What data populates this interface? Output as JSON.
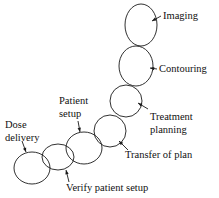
{
  "diagram": {
    "type": "chain-of-ellipses-flow",
    "stroke_color": "#1a1a1a",
    "background_color": "#ffffff",
    "text_color": "#111111",
    "nodes": [
      {
        "id": "imaging",
        "order": 1,
        "cx": 141,
        "cy": 25,
        "rx": 16,
        "ry": 21
      },
      {
        "id": "contouring",
        "order": 2,
        "cx": 136,
        "cy": 66,
        "rx": 17,
        "ry": 20
      },
      {
        "id": "treatment-planning",
        "order": 3,
        "cx": 126,
        "cy": 101,
        "rx": 16,
        "ry": 16
      },
      {
        "id": "transfer-of-plan",
        "order": 4,
        "cx": 110,
        "cy": 131,
        "rx": 16,
        "ry": 16
      },
      {
        "id": "patient-setup",
        "order": 5,
        "cx": 84,
        "cy": 148,
        "rx": 18,
        "ry": 16
      },
      {
        "id": "verify-patient-setup",
        "order": 6,
        "cx": 58,
        "cy": 157,
        "rx": 16,
        "ry": 13
      },
      {
        "id": "dose-delivery",
        "order": 7,
        "cx": 32,
        "cy": 168,
        "rx": 18,
        "ry": 16
      }
    ],
    "labels": [
      {
        "id": "imaging",
        "lines": [
          "Imaging"
        ],
        "x": 163,
        "y": 19,
        "leader": {
          "x1": 161,
          "y1": 16,
          "x2": 152,
          "y2": 21
        }
      },
      {
        "id": "contouring",
        "lines": [
          "Contouring"
        ],
        "x": 159,
        "y": 72,
        "leader": {
          "x1": 157,
          "y1": 69,
          "x2": 150,
          "y2": 68
        }
      },
      {
        "id": "treatment-planning",
        "lines": [
          "Treatment",
          "planning"
        ],
        "x": 150,
        "y": 120,
        "leader": {
          "x1": 148,
          "y1": 109,
          "x2": 138,
          "y2": 103
        }
      },
      {
        "id": "transfer-of-plan",
        "lines": [
          "Transfer of plan"
        ],
        "x": 125,
        "y": 158,
        "leader": {
          "x1": 128,
          "y1": 150,
          "x2": 119,
          "y2": 141
        }
      },
      {
        "id": "patient-setup",
        "lines": [
          "Patient",
          "setup"
        ],
        "x": 59,
        "y": 104,
        "leader": {
          "x1": 78,
          "y1": 121,
          "x2": 80,
          "y2": 132
        }
      },
      {
        "id": "verify-patient-setup",
        "lines": [
          "Verify patient setup"
        ],
        "x": 66,
        "y": 191,
        "leader": {
          "x1": 69,
          "y1": 182,
          "x2": 66,
          "y2": 170
        }
      },
      {
        "id": "dose-delivery",
        "lines": [
          "Dose",
          "delivery"
        ],
        "x": 5,
        "y": 128,
        "leader": {
          "x1": 22,
          "y1": 141,
          "x2": 26,
          "y2": 152
        }
      }
    ]
  }
}
